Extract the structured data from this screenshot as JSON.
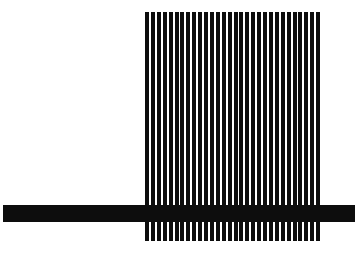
{
  "canvas": {
    "width": 359,
    "height": 257,
    "background_color": "#ffffff",
    "ink_color": "#0d0d0d"
  },
  "artwork": {
    "title": "Abstract black-and-white comb figure",
    "description": "A dense block of vertical black stripes crossed near its lower third by a single long horizontal black bar that extends past the stripes on both sides.",
    "stripe_block": {
      "name": "vertical-stripe-block",
      "x": 145,
      "y": 12,
      "width": 177,
      "height": 229,
      "stripe_count": 30,
      "period": 5.9,
      "stripe_width": 4,
      "gap_width": 1.9,
      "color": "#0d0d0d"
    },
    "horizontal_bar": {
      "name": "horizontal-bar",
      "x": 3,
      "y": 205,
      "width": 352,
      "height": 17,
      "color": "#0d0d0d"
    },
    "teeth_below_bar": {
      "name": "comb-teeth",
      "top": 222,
      "bottom": 241,
      "height": 19
    }
  }
}
